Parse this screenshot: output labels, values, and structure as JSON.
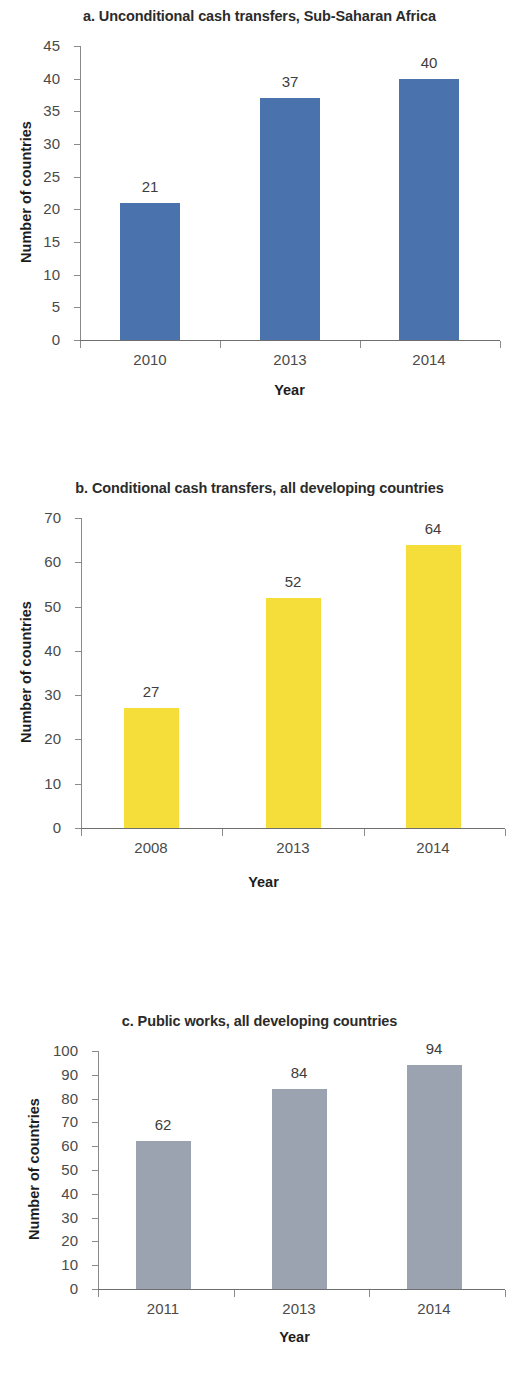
{
  "figure": {
    "background": "#ffffff"
  },
  "chart_data": [
    {
      "id": "a",
      "type": "bar",
      "title": "a. Unconditional cash transfers, Sub-Saharan Africa",
      "categories": [
        "2010",
        "2013",
        "2014"
      ],
      "values": [
        21,
        37,
        40
      ],
      "value_labels": [
        "21",
        "37",
        "40"
      ],
      "xlabel": "Year",
      "ylabel": "Number of countries",
      "ylim": [
        0,
        45
      ],
      "ytick_step": 5,
      "yticks": [
        "45",
        "40",
        "35",
        "30",
        "25",
        "20",
        "15",
        "10",
        "5",
        "0"
      ],
      "bar_color": "#4A73AD",
      "grid": false,
      "legend": "none"
    },
    {
      "id": "b",
      "type": "bar",
      "title": "b. Conditional cash transfers, all developing countries",
      "categories": [
        "2008",
        "2013",
        "2014"
      ],
      "values": [
        27,
        52,
        64
      ],
      "value_labels": [
        "27",
        "52",
        "64"
      ],
      "xlabel": "Year",
      "ylabel": "Number of countries",
      "ylim": [
        0,
        70
      ],
      "ytick_step": 10,
      "yticks": [
        "70",
        "60",
        "50",
        "40",
        "30",
        "20",
        "10",
        "0"
      ],
      "bar_color": "#F5DD3A",
      "grid": false,
      "legend": "none"
    },
    {
      "id": "c",
      "type": "bar",
      "title": "c. Public works, all developing countries",
      "categories": [
        "2011",
        "2013",
        "2014"
      ],
      "values": [
        62,
        84,
        94
      ],
      "value_labels": [
        "62",
        "84",
        "94"
      ],
      "xlabel": "Year",
      "ylabel": "Number of countries",
      "ylim": [
        0,
        100
      ],
      "ytick_step": 10,
      "yticks": [
        "100",
        "90",
        "80",
        "70",
        "60",
        "50",
        "40",
        "30",
        "20",
        "10",
        "0"
      ],
      "bar_color": "#9BA3B0",
      "grid": false,
      "legend": "none"
    }
  ]
}
